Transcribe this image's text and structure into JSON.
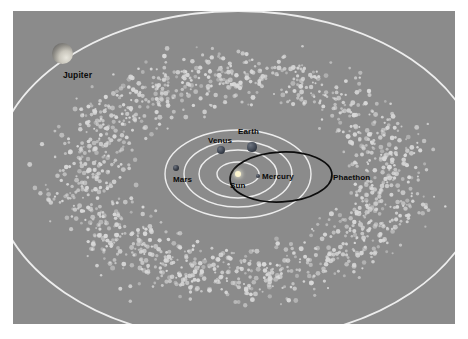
{
  "figure": {
    "kind": "solar-system-diagram",
    "canvas": {
      "width": 468,
      "height": 339
    },
    "plate": {
      "x": 13,
      "y": 11,
      "width": 442,
      "height": 313
    },
    "background_color": "#8b8b8b",
    "page_color": "#ffffff",
    "orbit_color": "#f2f2f2",
    "phaethon_orbit_color": "#0d0d0d",
    "asteroid_color": "#d8d8d8",
    "label_color": "#0a0a0a"
  },
  "sun": {
    "label": "Sun",
    "color": "#fdf6d0",
    "cx": 238,
    "cy": 174,
    "r": 3.2,
    "label_x": 230,
    "label_y": 181
  },
  "planets": [
    {
      "name": "Mercury",
      "label": "Mercury",
      "cx": 258,
      "cy": 176,
      "r": 2.0,
      "color": "#3a3f4a",
      "label_x": 262,
      "label_y": 172
    },
    {
      "name": "Venus",
      "label": "Venus",
      "cx": 221,
      "cy": 150,
      "r": 4.2,
      "color": "#3d4450",
      "label_x": 208,
      "label_y": 136
    },
    {
      "name": "Earth",
      "label": "Earth",
      "cx": 252,
      "cy": 147,
      "r": 4.6,
      "color": "#414854",
      "label_x": 238,
      "label_y": 127
    },
    {
      "name": "Mars",
      "label": "Mars",
      "cx": 176,
      "cy": 168,
      "r": 3.2,
      "color": "#353a44",
      "label_x": 173,
      "label_y": 175
    },
    {
      "name": "Jupiter",
      "label": "Jupiter",
      "cx": 62,
      "cy": 53,
      "r": 10.5,
      "color": "#9a9a9a",
      "label_x": 63,
      "label_y": 71
    }
  ],
  "phaethon": {
    "label": "Phaethon",
    "label_x": 333,
    "label_y": 173,
    "orbit": {
      "cx": 281,
      "cy": 177,
      "rx": 51,
      "ry": 25,
      "rotation": -3
    }
  },
  "orbits": [
    {
      "name": "mercury-orbit",
      "cx": 238,
      "cy": 174,
      "rx": 21,
      "ry": 12
    },
    {
      "name": "venus-orbit",
      "cx": 238,
      "cy": 174,
      "rx": 39,
      "ry": 24
    },
    {
      "name": "earth-orbit",
      "cx": 238,
      "cy": 174,
      "rx": 54,
      "ry": 33
    },
    {
      "name": "mars-orbit",
      "cx": 238,
      "cy": 174,
      "rx": 73,
      "ry": 44
    },
    {
      "name": "jupiter-orbit",
      "cx": 238,
      "cy": 176,
      "rx": 245,
      "ry": 165
    }
  ],
  "asteroid_belt": {
    "name": "asteroid-belt",
    "inner_rx": 95,
    "inner_ry": 60,
    "outer_rx": 215,
    "outer_ry": 142,
    "count": 1450,
    "center_x": 238,
    "center_y": 176
  }
}
